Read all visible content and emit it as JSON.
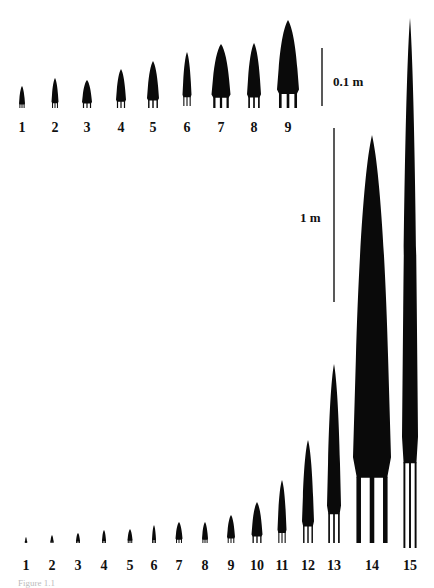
{
  "figure": {
    "top_panel": {
      "scale_bar_label": "0.1 m",
      "items": [
        {
          "label": "1",
          "x": 22,
          "top": 86,
          "bottom": 108,
          "w": 6
        },
        {
          "label": "2",
          "x": 55,
          "top": 78,
          "bottom": 108,
          "w": 7
        },
        {
          "label": "3",
          "x": 87,
          "top": 80,
          "bottom": 108,
          "w": 10
        },
        {
          "label": "4",
          "x": 121,
          "top": 69,
          "bottom": 108,
          "w": 10
        },
        {
          "label": "5",
          "x": 153,
          "top": 61,
          "bottom": 108,
          "w": 12
        },
        {
          "label": "6",
          "x": 187,
          "top": 52,
          "bottom": 106,
          "w": 9
        },
        {
          "label": "7",
          "x": 221,
          "top": 44,
          "bottom": 108,
          "w": 19
        },
        {
          "label": "8",
          "x": 254,
          "top": 43,
          "bottom": 108,
          "w": 14
        },
        {
          "label": "9",
          "x": 288,
          "top": 20,
          "bottom": 108,
          "w": 22
        }
      ],
      "label_y": 120
    },
    "bottom_panel": {
      "scale_bar_label": "1 m",
      "items": [
        {
          "label": "1",
          "x": 26,
          "top": 537,
          "bottom": 543,
          "w": 2
        },
        {
          "label": "2",
          "x": 52,
          "top": 535,
          "bottom": 543,
          "w": 3
        },
        {
          "label": "3",
          "x": 78,
          "top": 533,
          "bottom": 543,
          "w": 4
        },
        {
          "label": "4",
          "x": 104,
          "top": 530,
          "bottom": 543,
          "w": 4
        },
        {
          "label": "5",
          "x": 130,
          "top": 529,
          "bottom": 543,
          "w": 5
        },
        {
          "label": "6",
          "x": 154,
          "top": 525,
          "bottom": 543,
          "w": 4
        },
        {
          "label": "7",
          "x": 179,
          "top": 522,
          "bottom": 543,
          "w": 7
        },
        {
          "label": "8",
          "x": 205,
          "top": 522,
          "bottom": 543,
          "w": 6
        },
        {
          "label": "9",
          "x": 231,
          "top": 515,
          "bottom": 543,
          "w": 8
        },
        {
          "label": "10",
          "x": 257,
          "top": 502,
          "bottom": 543,
          "w": 11
        },
        {
          "label": "11",
          "x": 282,
          "top": 480,
          "bottom": 543,
          "w": 9
        },
        {
          "label": "12",
          "x": 308,
          "top": 440,
          "bottom": 543,
          "w": 12
        },
        {
          "label": "13",
          "x": 334,
          "top": 364,
          "bottom": 543,
          "w": 14
        },
        {
          "label": "14",
          "x": 372,
          "top": 135,
          "bottom": 543,
          "w": 38
        },
        {
          "label": "15",
          "x": 410,
          "top": 18,
          "bottom": 548,
          "w": 16
        }
      ],
      "label_y": 558
    },
    "caption": "Figure 1.1"
  }
}
